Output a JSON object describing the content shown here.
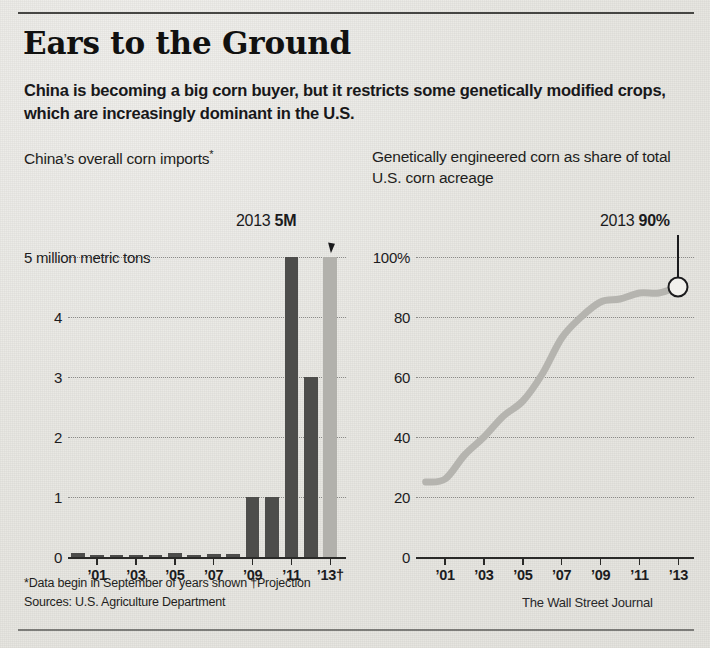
{
  "headline": "Ears to the Ground",
  "dek": "China is becoming a big corn buyer, but it restricts some genetically modified crops, which are increasingly dominant in the U.S.",
  "panels": {
    "left": {
      "title": "China’s overall corn imports",
      "title_marker": "*",
      "callout_year": "2013",
      "callout_value": "5M"
    },
    "right": {
      "title": "Genetically engineered corn as share of total U.S. corn acreage",
      "callout_year": "2013",
      "callout_value": "90%"
    }
  },
  "footnotes": {
    "line1": "*Data begin in September of years shown  †Projection",
    "line2": "Sources: U.S. Agriculture Department",
    "credit": "The Wall Street Journal"
  },
  "colors": {
    "bar_actual": "#4d4d4b",
    "bar_projection": "#b2b1ac",
    "line": "#b5b4af",
    "ink": "#1b1b1d",
    "paper": "#e8e7e3"
  },
  "chart_data": [
    {
      "type": "bar",
      "title": "China’s overall corn imports*",
      "xlabel": "",
      "ylabel": "5 million metric tons",
      "ylim": [
        0,
        5
      ],
      "yticks": [
        0,
        1,
        2,
        3,
        4,
        5
      ],
      "ytick_labels": [
        "0",
        "1",
        "2",
        "3",
        "4",
        "5 million metric tons"
      ],
      "grid": true,
      "x_tick_labels": [
        "’01",
        "’03",
        "’05",
        "’07",
        "’09",
        "’11",
        "’13†"
      ],
      "categories": [
        "2000",
        "2001",
        "2002",
        "2003",
        "2004",
        "2005",
        "2006",
        "2007",
        "2008",
        "2009",
        "2010",
        "2011",
        "2012",
        "2013"
      ],
      "values": [
        0.07,
        0.04,
        0.01,
        0.01,
        0.01,
        0.07,
        0.03,
        0.05,
        0.05,
        1.0,
        1.0,
        5.0,
        3.0,
        5.0
      ],
      "projection_index": 13,
      "annotation": {
        "label_year": "2013",
        "label_value": "5M",
        "points_to": "2013"
      }
    },
    {
      "type": "line",
      "title": "Genetically engineered corn as share of total U.S. corn acreage",
      "xlabel": "",
      "ylabel": "",
      "ylim": [
        0,
        100
      ],
      "yticks": [
        0,
        20,
        40,
        60,
        80,
        100
      ],
      "ytick_labels": [
        "0",
        "20",
        "40",
        "60",
        "80",
        "100%"
      ],
      "grid": true,
      "x_tick_labels": [
        "’01",
        "’03",
        "’05",
        "’07",
        "’09",
        "’11",
        "’13"
      ],
      "x": [
        2000,
        2001,
        2002,
        2003,
        2004,
        2005,
        2006,
        2007,
        2008,
        2009,
        2010,
        2011,
        2012,
        2013
      ],
      "values": [
        25,
        26,
        34,
        40,
        47,
        52,
        61,
        73,
        80,
        85,
        86,
        88,
        88,
        90
      ],
      "end_marker": {
        "x": 2013,
        "y": 90,
        "label_year": "2013",
        "label_value": "90%"
      }
    }
  ]
}
